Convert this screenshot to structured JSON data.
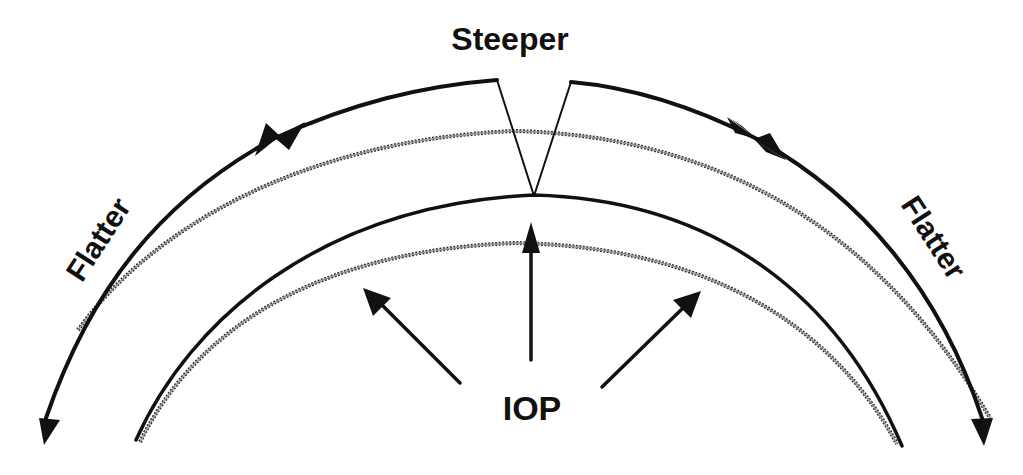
{
  "diagram": {
    "labels": {
      "top": "Steeper",
      "left": "Flatter",
      "right": "Flatter",
      "bottom": "IOP"
    },
    "elements": {
      "outer_solid_curve": "deformed outer corneal surface",
      "outer_dotted_curve": "original outer corneal surface",
      "inner_solid_curve": "deformed inner corneal surface",
      "inner_dotted_curve": "original inner corneal surface",
      "pressure_arrows": 3,
      "apex_pointer_lines": 2
    },
    "colors": {
      "ink": "#111111",
      "background": "#ffffff"
    }
  }
}
